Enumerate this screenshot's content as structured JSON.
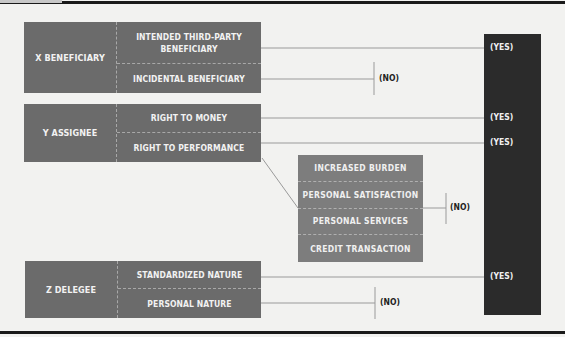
{
  "diagram": {
    "groups": [
      {
        "id": "x",
        "label": "X BENEFICIARY",
        "items": [
          {
            "label": "INTENDED THIRD-PARTY BENEFICIARY",
            "line1": "INTENDED THIRD-PARTY",
            "line2": "BENEFICIARY",
            "outcome": "(YES)"
          },
          {
            "label": "INCIDENTAL BENEFICIARY",
            "outcome": "(NO)"
          }
        ]
      },
      {
        "id": "y",
        "label": "Y ASSIGNEE",
        "items": [
          {
            "label": "RIGHT TO MONEY",
            "outcome": "(YES)"
          },
          {
            "label": "RIGHT TO PERFORMANCE",
            "outcome": "(YES)"
          }
        ]
      },
      {
        "id": "z",
        "label": "Z DELEGEE",
        "items": [
          {
            "label": "STANDARDIZED NATURE",
            "outcome": "(YES)"
          },
          {
            "label": "PERSONAL NATURE",
            "outcome": "(NO)"
          }
        ]
      }
    ],
    "exceptions": {
      "items": [
        "INCREASED BURDEN",
        "PERSONAL SATISFACTION",
        "PERSONAL SERVICES",
        "CREDIT TRANSACTION"
      ],
      "outcome": "(NO)"
    },
    "labels": {
      "yes": "(YES)",
      "no": "(NO)"
    },
    "colors": {
      "background": "#f2f2f0",
      "group_box": "#6b6b6b",
      "exception_box": "#7d7d7d",
      "yes_panel": "#2b2b2b",
      "connector": "#9a9a9a"
    }
  }
}
